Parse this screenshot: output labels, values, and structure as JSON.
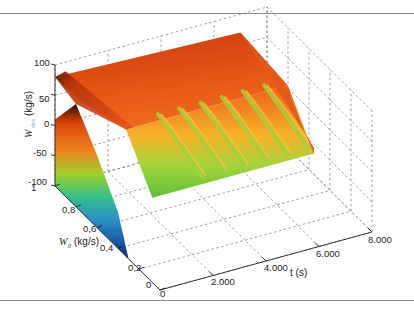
{
  "chart_data": {
    "type": "surface3d",
    "title": "",
    "axes": {
      "z": {
        "label_main": "W",
        "label_sub": "diss",
        "label_unit": "(kg/s)",
        "range": [
          -100,
          100
        ],
        "ticks": [
          100,
          50,
          0,
          -50,
          -100
        ],
        "tick_labels": [
          "100",
          "50",
          "0",
          "-50",
          "-100"
        ]
      },
      "w0": {
        "label_main": "W",
        "label_sub": "0",
        "label_unit": "(kg/s)",
        "range": [
          0,
          1
        ],
        "ticks": [
          1,
          0.8,
          0.6,
          0.4,
          0.2,
          0
        ],
        "tick_labels": [
          "1",
          "0,8",
          "0,6",
          "0,4",
          "0,2",
          "0"
        ]
      },
      "t": {
        "label": "t (s)",
        "range": [
          0,
          8000
        ],
        "ticks": [
          0,
          2000,
          4000,
          6000,
          8000
        ],
        "tick_labels": [
          "0",
          "2.000",
          "4.000",
          "6.000",
          "8.000"
        ]
      }
    },
    "grid": true,
    "colormap": "jet",
    "surface_description": "Wdiss rises from about -100 at W0=0.3/t=0 to about 80 near W0=1; for t>0 the surface is mostly ~60 with oscillating wave fronts (green troughs ~0) at W0 below ~0.5; surface ends at t≈7000 on the right",
    "wave_fronts_t": [
      2600,
      3400,
      4200,
      5000,
      5800,
      6600
    ],
    "surface_samples": {
      "w0": [
        1.0,
        0.8,
        0.6,
        0.4,
        0.3
      ],
      "wdiss_at_t0": [
        10,
        70,
        20,
        -40,
        -100
      ],
      "wdiss_plateau": 60,
      "wdiss_trough": 0
    }
  }
}
